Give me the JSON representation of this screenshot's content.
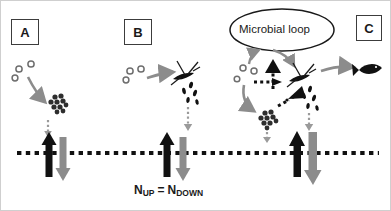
{
  "figure": {
    "title_visible": false,
    "background_color": "#ffffff",
    "border_color": "#cfcfcf",
    "width": 391,
    "height": 211
  },
  "colors": {
    "black": "#111111",
    "dark": "#1a1a1a",
    "gray_arrow": "#8c8c8c",
    "mid_gray": "#9a9a9a",
    "outline": "#3c3c3c",
    "dot_gray": "#6e6e6e"
  },
  "panels": [
    {
      "id": "A",
      "label": "A",
      "box": {
        "x": 10,
        "y": 18,
        "w": 28,
        "h": 26
      }
    },
    {
      "id": "B",
      "label": "B",
      "box": {
        "x": 123,
        "y": 18,
        "w": 28,
        "h": 26
      }
    },
    {
      "id": "C",
      "label": "C",
      "box": {
        "x": 355,
        "y": 14,
        "w": 26,
        "h": 26
      }
    }
  ],
  "oval": {
    "label": "Microbial loop",
    "center_x": 281,
    "center_y": 29,
    "rx": 52,
    "ry": 21,
    "stroke": "#1a1a1a"
  },
  "sediment_line": {
    "name": "sediment-water-interface",
    "y": 152,
    "x_start": 16,
    "x_end": 378,
    "style": "dotted",
    "color": "#111111"
  },
  "flux_equation": {
    "n_up": "N",
    "n_up_sub": "UP",
    "equals": "=",
    "n_down": "N",
    "n_down_sub": "DOWN",
    "x": 133,
    "y": 186
  },
  "flux_arrows": [
    {
      "panel": "A",
      "direction": "up",
      "color": "black",
      "x": 48,
      "label": "N-up-flux-A"
    },
    {
      "panel": "A",
      "direction": "down",
      "color": "gray",
      "x": 62,
      "label": "N-down-flux-A"
    },
    {
      "panel": "B",
      "direction": "up",
      "color": "black",
      "x": 166,
      "label": "N-up-flux-B"
    },
    {
      "panel": "B",
      "direction": "down",
      "color": "gray",
      "x": 182,
      "label": "N-down-flux-B"
    },
    {
      "panel": "C",
      "direction": "up",
      "color": "black",
      "x": 296,
      "label": "N-up-flux-C"
    },
    {
      "panel": "C",
      "direction": "down",
      "color": "gray",
      "x": 312,
      "label": "N-down-flux-C"
    }
  ],
  "organisms": {
    "nutrient_dots": "small gray open circles (dissolved nutrients)",
    "bacteria_aggregate": "dark clustered dot aggregate (bacterial aggregate)",
    "phytoplankton": "dark diatom / flagellate cell with spines",
    "detritus": "small black elongated particles (detritus / faecal pellets)",
    "fish": "black fish silhouette",
    "microbial_triangles": "black triangular arrowheads in microbial loop"
  },
  "legend_notes": {
    "black_arrow_meaning": "upward nitrogen flux",
    "gray_arrow_meaning": "downward nitrogen flux"
  }
}
